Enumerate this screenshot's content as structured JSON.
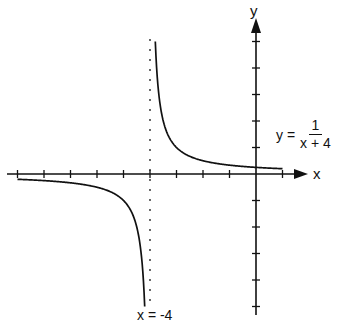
{
  "chart_data": {
    "type": "line",
    "title": "",
    "function": "y = 1/(x + 4)",
    "xlabel": "x",
    "ylabel": "y",
    "xlim": [
      -9.3,
      1.9
    ],
    "ylim": [
      -5.5,
      5.8
    ],
    "grid": false,
    "x_ticks": [
      -9,
      -8,
      -7,
      -6,
      -5,
      -4,
      -3,
      -2,
      -1,
      0,
      1
    ],
    "y_ticks": [
      -5,
      -4,
      -3,
      -2,
      -1,
      1,
      2,
      3,
      4,
      5
    ],
    "tick_labels_shown": false,
    "asymptotes": [
      {
        "type": "vertical",
        "x": -4,
        "style": "dotted",
        "label": "x = -4"
      },
      {
        "type": "horizontal",
        "y": 0,
        "style": "axis"
      }
    ],
    "series": [
      {
        "name": "left branch",
        "x": [
          -9,
          -8,
          -7,
          -6,
          -5,
          -4.5,
          -4.3,
          -4.2
        ],
        "y": [
          -0.2,
          -0.25,
          -0.333,
          -0.5,
          -1,
          -2,
          -3.333,
          -5
        ]
      },
      {
        "name": "right branch",
        "x": [
          -3.8,
          -3.7,
          -3.5,
          -3,
          -2,
          -1,
          0,
          1
        ],
        "y": [
          5,
          3.333,
          2,
          1,
          0.5,
          0.333,
          0.25,
          0.2
        ]
      }
    ],
    "annotations": [
      {
        "text": "y = 1/(x + 4)",
        "position": "right of y-axis, above x-axis"
      },
      {
        "text": "x = -4",
        "position": "bottom, under asymptote"
      }
    ]
  },
  "labels": {
    "x_axis": "x",
    "y_axis": "y",
    "equation_lhs": "y =",
    "equation_numerator": "1",
    "equation_denominator": "x + 4",
    "asymptote": "x = -4"
  },
  "colors": {
    "ink": "#111111",
    "background": "#ffffff"
  }
}
